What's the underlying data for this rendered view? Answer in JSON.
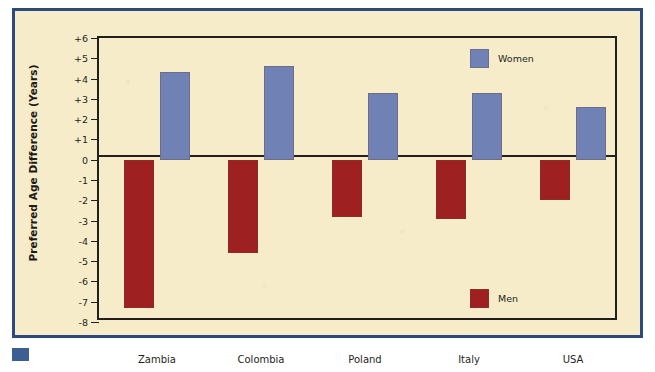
{
  "chart_data": {
    "type": "bar",
    "title": "",
    "subtitle": "",
    "xlabel": "",
    "ylabel": "Preferred Age Difference (Years)",
    "categories": [
      "Zambia",
      "Colombia",
      "Poland",
      "Italy",
      "USA"
    ],
    "series": [
      {
        "name": "Men",
        "color": "#9E2020",
        "values": [
          -7.3,
          -4.6,
          -2.8,
          -2.9,
          -2.0
        ]
      },
      {
        "name": "Women",
        "color": "#6F81B5",
        "values": [
          4.3,
          4.6,
          3.3,
          3.3,
          2.6
        ]
      }
    ],
    "ylim": [
      -8,
      6
    ],
    "ytick_values": [
      6,
      5,
      4,
      3,
      2,
      1,
      0,
      -1,
      -2,
      -3,
      -4,
      -5,
      -6,
      -7,
      -8
    ],
    "ytick_labels": [
      "+6",
      "+5",
      "+4",
      "+3",
      "+2",
      "+1",
      "0",
      "-1",
      "-2",
      "-3",
      "-4",
      "-5",
      "-6",
      "-7",
      "-8"
    ],
    "grid": false,
    "legend_position": "inside-right",
    "legend": [
      {
        "label": "Women",
        "color": "#6F81B5",
        "position": "top-right"
      },
      {
        "label": "Men",
        "color": "#9E2020",
        "position": "bottom-right"
      }
    ],
    "annotations": []
  },
  "figure": {
    "background_color": "#F6ECC9",
    "frame_color": "#2C4B7C",
    "axis_color": "#231F1C",
    "text_color": "#241F1B",
    "marker_color": "#3C5E92"
  }
}
